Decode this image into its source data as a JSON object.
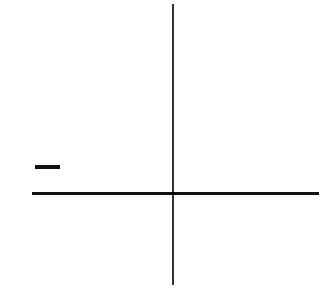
{
  "diagram": {
    "type": "coordinate-axes",
    "elements": {
      "vertical_axis": {
        "orientation": "vertical",
        "x": 173,
        "y_start": 4,
        "y_end": 285
      },
      "horizontal_axis": {
        "orientation": "horizontal",
        "y": 193,
        "x_start": 32,
        "x_end": 319
      },
      "origin": {
        "x": 173,
        "y": 193
      },
      "minus_marker": {
        "symbol": "−",
        "x_start": 35,
        "x_end": 60,
        "y": 167
      }
    },
    "colors": {
      "background": "#ffffff",
      "line": "#111111",
      "vertical_line": "#333333"
    }
  }
}
